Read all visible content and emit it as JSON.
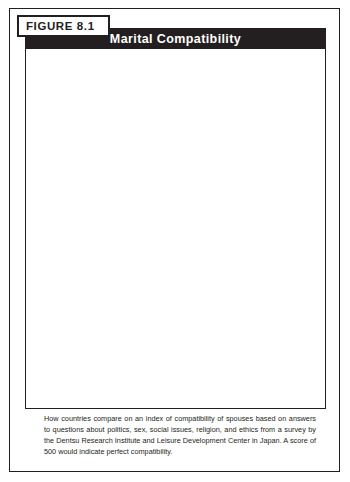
{
  "figure": {
    "tag": "FIGURE  8.1",
    "title": "Marital Compatibility",
    "caption": "How countries compare on an index of compatibility of spouses based on answers to questions about politics, sex, social issues, religion, and ethics from a survey by the Dentsu Research Institute and Leisure Development Center in Japan. A score of 500 would indicate perfect compatibility."
  },
  "annotation": {
    "average_word": "Average",
    "average_value": "316"
  },
  "colors": {
    "ink": "#231f20",
    "banner_bg": "#231f20",
    "banner_text": "#ffffff",
    "bar_light": "#f2f2f2",
    "bar_dark": "#111111",
    "track_border": "#58595b",
    "page_bg": "#ffffff"
  },
  "chart_data": {
    "type": "bar",
    "orientation": "horizontal",
    "title": "Marital Compatibility",
    "xlabel": "",
    "ylabel": "",
    "xlim": [
      0,
      500
    ],
    "ticks": [
      0,
      100,
      200,
      300,
      400,
      500
    ],
    "grid": false,
    "legend": "none",
    "average_line": 316,
    "categories": [
      "Turkey",
      "Spain",
      "Nigeria",
      "Ireland",
      "Sweden",
      "U.S.",
      "Brazil",
      "Canada",
      "India",
      "Denmark",
      "Britain",
      "Italy",
      "Hungary",
      "Mexico",
      "France",
      "China",
      "Belgium",
      "Belarus",
      "Russia",
      "Finland",
      "Japan"
    ],
    "values": [
      432,
      415,
      405,
      403,
      373,
      365,
      358,
      358,
      358,
      352,
      350,
      336,
      329,
      323,
      323,
      316,
      307,
      245,
      243,
      236,
      196
    ]
  }
}
